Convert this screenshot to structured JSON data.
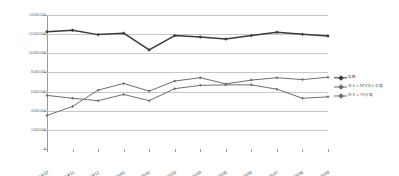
{
  "chart_data": {
    "type": "line",
    "title": "",
    "subtitle": "",
    "xlabel": "",
    "ylabel": "",
    "categories": [
      "2014/10",
      "2014/11",
      "2014/12",
      "2015/01",
      "2015/02",
      "2015/03",
      "2015/04",
      "2015/05",
      "2015/06",
      "2015/07",
      "2015/08",
      "2015/09"
    ],
    "ylim": [
      0,
      14000000
    ],
    "ytick_labels": [
      "0",
      "2,000,000",
      "4,000,000",
      "6,000,000",
      "8,000,000",
      "10,000,000",
      "12,000,000",
      "14,000,000"
    ],
    "ytick_values": [
      0,
      2000000,
      4000000,
      6000000,
      8000000,
      10000000,
      12000000,
      14000000
    ],
    "grid": true,
    "legend_position": "right",
    "series": [
      {
        "name": "総数",
        "color": "#3a3a3a",
        "marker": "diamond",
        "values": [
          12250000,
          12400000,
          11950000,
          12100000,
          10350000,
          11850000,
          11700000,
          11500000,
          11850000,
          12200000,
          11980000,
          11800000
        ]
      },
      {
        "name": "日テレNTV法人会員",
        "color": "#6e6e6e",
        "marker": "diamond",
        "values": [
          3500000,
          4450000,
          6150000,
          6850000,
          6050000,
          7100000,
          7450000,
          6800000,
          7200000,
          7450000,
          7250000,
          7500000
        ]
      },
      {
        "name": "日テレTV会員",
        "color": "#6e6e6e",
        "marker": "diamond",
        "values": [
          5600000,
          5300000,
          5050000,
          5700000,
          5050000,
          6300000,
          6650000,
          6700000,
          6700000,
          6250000,
          5300000,
          5450000
        ]
      }
    ]
  }
}
